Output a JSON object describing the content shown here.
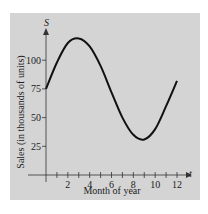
{
  "chart_data": {
    "type": "line",
    "title": "",
    "xlabel": "Month of year",
    "ylabel": "Sales (in thousands of units)",
    "x_axis_var": "t",
    "y_axis_var": "S",
    "xlim": [
      0,
      12
    ],
    "ylim": [
      0,
      125
    ],
    "x_ticks": [
      1,
      2,
      3,
      4,
      5,
      6,
      7,
      8,
      9,
      10,
      11,
      12
    ],
    "x_tick_labels": [
      "2",
      "4",
      "6",
      "8",
      "10",
      "12"
    ],
    "x_tick_label_values": [
      2,
      4,
      6,
      8,
      10,
      12
    ],
    "y_ticks": [
      25,
      50,
      75,
      100
    ],
    "y_tick_labels": [
      "25",
      "50",
      "75",
      "100"
    ],
    "grid": false,
    "legend": null,
    "series": [
      {
        "name": "S",
        "x": [
          0,
          1,
          2,
          3,
          4,
          5,
          6,
          7,
          8,
          9,
          10,
          11,
          12
        ],
        "values": [
          75,
          98,
          115,
          119,
          112,
          95,
          72,
          50,
          35,
          31,
          40,
          60,
          82
        ]
      }
    ],
    "colors": {
      "panel": "#d4d4d4",
      "line": "#111111",
      "axis": "#333333"
    }
  }
}
